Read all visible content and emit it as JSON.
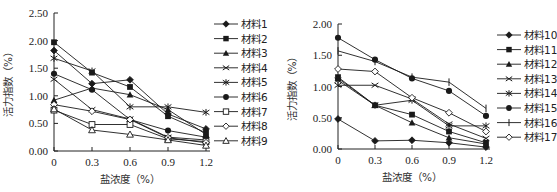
{
  "chart_data": [
    {
      "type": "line",
      "title": "",
      "xlabel": "盐浓度（%）",
      "ylabel": "活力指数（%）",
      "x": [
        0,
        0.3,
        0.6,
        0.9,
        1.2
      ],
      "x_tick_labels": [
        "0",
        "0.3",
        "0.6",
        "0.9",
        "1.2"
      ],
      "y_tick_labels": [
        "0.00",
        "0.50",
        "1.00",
        "1.50",
        "2.00",
        "2.50"
      ],
      "ylim": [
        0,
        2.5
      ],
      "grid": false,
      "legend_position": "right",
      "series": [
        {
          "name": "材料1",
          "marker": "filled-diamond",
          "values": [
            1.82,
            1.22,
            1.29,
            0.67,
            0.4
          ]
        },
        {
          "name": "材料2",
          "marker": "filled-square",
          "values": [
            1.97,
            1.42,
            1.16,
            0.63,
            0.33
          ]
        },
        {
          "name": "材料3",
          "marker": "filled-triangle",
          "values": [
            0.92,
            1.14,
            1.02,
            0.75,
            0.3
          ]
        },
        {
          "name": "材料4",
          "marker": "x",
          "values": [
            1.3,
            0.75,
            0.58,
            0.25,
            0.2
          ]
        },
        {
          "name": "材料5",
          "marker": "asterisk",
          "values": [
            1.68,
            1.45,
            0.8,
            0.8,
            0.7
          ]
        },
        {
          "name": "材料6",
          "marker": "filled-circle",
          "values": [
            1.4,
            1.11,
            0.57,
            0.37,
            0.25
          ]
        },
        {
          "name": "材料7",
          "marker": "open-square",
          "values": [
            0.74,
            0.48,
            0.48,
            0.22,
            0.17
          ]
        },
        {
          "name": "材料8",
          "marker": "open-diamond",
          "values": [
            0.84,
            0.72,
            0.57,
            0.24,
            0.15
          ]
        },
        {
          "name": "材料9",
          "marker": "open-triangle",
          "values": [
            0.76,
            0.38,
            0.3,
            0.2,
            0.1
          ]
        }
      ]
    },
    {
      "type": "line",
      "title": "",
      "xlabel": "盐浓度（%）",
      "ylabel": "活力指数（%）",
      "x": [
        0,
        0.3,
        0.6,
        0.9,
        1.2
      ],
      "x_tick_labels": [
        "0",
        "0.3",
        "0.6",
        "0.9",
        "1.2"
      ],
      "y_tick_labels": [
        "0.00",
        "0.50",
        "1.00",
        "1.50",
        "2.00"
      ],
      "ylim": [
        0,
        2.0
      ],
      "grid": false,
      "legend_position": "right",
      "series": [
        {
          "name": "材料10",
          "marker": "filled-diamond",
          "values": [
            0.48,
            0.13,
            0.14,
            0.1,
            0.03
          ]
        },
        {
          "name": "材料11",
          "marker": "filled-square",
          "values": [
            1.15,
            0.7,
            0.55,
            0.28,
            0.1
          ]
        },
        {
          "name": "材料12",
          "marker": "filled-triangle",
          "values": [
            1.13,
            0.7,
            0.42,
            0.18,
            0.08
          ]
        },
        {
          "name": "材料13",
          "marker": "x",
          "values": [
            1.02,
            1.02,
            0.8,
            0.4,
            0.17
          ]
        },
        {
          "name": "材料14",
          "marker": "asterisk",
          "values": [
            1.1,
            0.7,
            0.78,
            0.37,
            0.37
          ]
        },
        {
          "name": "材料15",
          "marker": "filled-circle",
          "values": [
            1.78,
            1.43,
            1.13,
            0.93,
            0.53
          ]
        },
        {
          "name": "材料16",
          "marker": "plus",
          "values": [
            1.57,
            1.4,
            1.15,
            1.07,
            0.65
          ]
        },
        {
          "name": "材料17",
          "marker": "open-diamond",
          "values": [
            1.28,
            1.24,
            0.82,
            0.58,
            0.28
          ]
        }
      ]
    }
  ],
  "style": {
    "line_color": "#1a1a1a",
    "axis_color": "#222222"
  }
}
